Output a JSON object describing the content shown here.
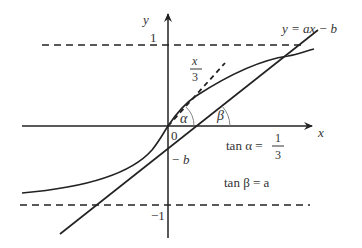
{
  "figure": {
    "type": "function-graph",
    "axes": {
      "x_label": "x",
      "y_label": "y",
      "origin_label": "0"
    },
    "ticks": {
      "y_top": "1",
      "y_bottom": "−1",
      "y_intercept": "− b"
    },
    "line": {
      "equation": "y = ax − b"
    },
    "tangent": {
      "label_num": "x",
      "label_den": "3"
    },
    "angles": {
      "alpha": "α",
      "beta": "β"
    },
    "annotations": {
      "tan_alpha_lhs": "tan α =",
      "tan_alpha_num": "1",
      "tan_alpha_den": "3",
      "tan_beta": "tan β = a"
    },
    "colors": {
      "stroke": "#222222",
      "text": "#333333",
      "background": "#ffffff"
    }
  }
}
